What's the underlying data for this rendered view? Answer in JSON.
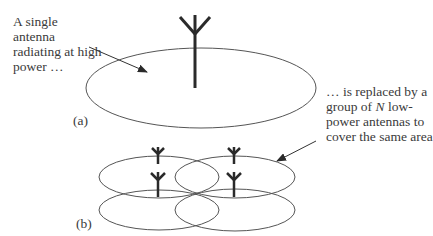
{
  "diagram": {
    "panel_a": {
      "label": "(a)",
      "description_lines": [
        "A single",
        "antenna",
        "radiating at high",
        "power …"
      ]
    },
    "panel_b": {
      "label": "(b)",
      "description_lines": [
        "… is replaced by  a",
        "group of ",
        "N",
        " low-",
        "power antennas to",
        "cover the same area"
      ]
    },
    "colors": {
      "stroke": "#555555",
      "antenna": "#2a2a2a",
      "text": "#3a3a3a",
      "background": "#ffffff"
    }
  }
}
